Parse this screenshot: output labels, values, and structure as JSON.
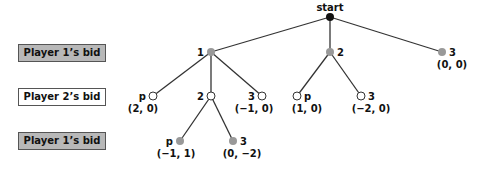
{
  "row_labels": [
    {
      "label": "Player 1’s bid",
      "style": "shaded"
    },
    {
      "label": "Player 2’s bid",
      "style": "white"
    },
    {
      "label": "Player 1’s bid",
      "style": "shaded"
    }
  ],
  "colors": {
    "root": "#111111",
    "player1_node": "#999999",
    "player2_node": "#ffffff",
    "edge": "#333333",
    "shaded_label": "#b8b8b8"
  },
  "tree": {
    "root": {
      "label": "start"
    },
    "level1": [
      {
        "label": "1"
      },
      {
        "label": "2"
      },
      {
        "label": "3",
        "payoff": "(0, 0)"
      }
    ],
    "level2_from_1": [
      {
        "label": "p",
        "payoff": "(2, 0)"
      },
      {
        "label": "2"
      },
      {
        "label": "3",
        "payoff": "(−1, 0)"
      }
    ],
    "level2_from_2": [
      {
        "label": "p",
        "payoff": "(1, 0)"
      },
      {
        "label": "3",
        "payoff": "(−2, 0)"
      }
    ],
    "level3_from_1_2": [
      {
        "label": "p",
        "payoff": "(−1, 1)"
      },
      {
        "label": "3",
        "payoff": "(0, −2)"
      }
    ]
  }
}
